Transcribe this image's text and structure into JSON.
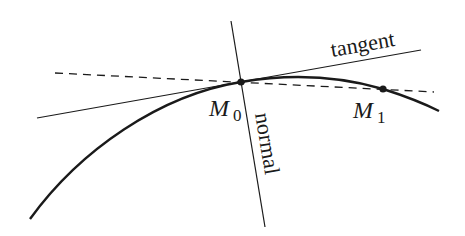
{
  "diagram": {
    "labels": {
      "tangent": "tangent",
      "normal": "normal",
      "m0_main": "M",
      "m0_sub": "0",
      "m1_main": "M",
      "m1_sub": "1"
    },
    "points": {
      "M0": {
        "x": 241,
        "y": 82
      },
      "M1": {
        "x": 383,
        "y": 89
      }
    },
    "colors": {
      "stroke": "#1a1a1a",
      "background": "#ffffff"
    }
  }
}
